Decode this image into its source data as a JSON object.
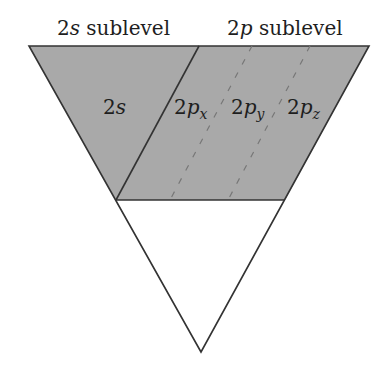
{
  "header": {
    "s_label": {
      "num": "2",
      "letter": "s",
      "rest": " sublevel"
    },
    "p_label": {
      "num": "2",
      "letter": "p",
      "rest": " sublevel"
    }
  },
  "orbitals": [
    {
      "num": "2",
      "letter": "s",
      "sub": ""
    },
    {
      "num": "2",
      "letter": "p",
      "sub": "x"
    },
    {
      "num": "2",
      "letter": "p",
      "sub": "y"
    },
    {
      "num": "2",
      "letter": "p",
      "sub": "z"
    }
  ],
  "colors": {
    "shade": "#a8a8a8",
    "stroke": "#333333",
    "dash": "#777777"
  }
}
